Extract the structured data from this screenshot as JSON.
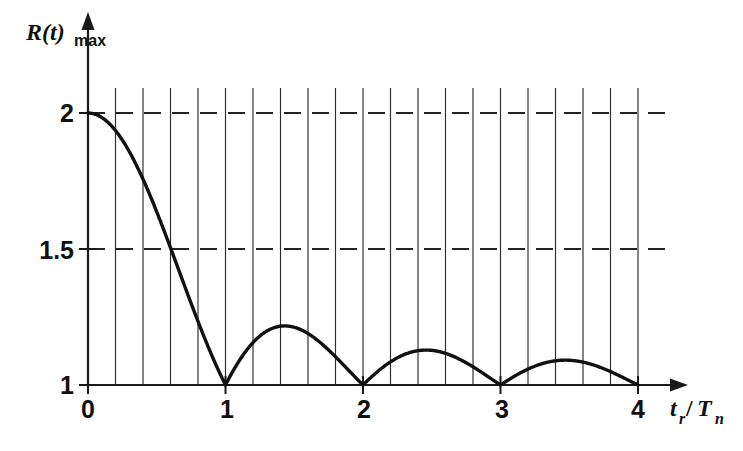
{
  "chart_data": {
    "type": "line",
    "title": "",
    "subtitle": "",
    "xlabel": "t_r/T_n",
    "ylabel": "R(t)max",
    "xlabel_parts": {
      "base1": "t",
      "sub1": "r",
      "slash": "/",
      "base2": "T",
      "sub2": "n"
    },
    "ylabel_parts": {
      "base": "R(t)",
      "sub": "max"
    },
    "xlim": [
      0,
      4
    ],
    "ylim": [
      1,
      2
    ],
    "x_ticks": [
      0,
      1,
      2,
      3,
      4
    ],
    "x_tick_labels": [
      "0",
      "1",
      "2",
      "3",
      "4"
    ],
    "y_ticks": [
      1,
      1.5,
      2
    ],
    "y_tick_labels": [
      "1",
      "1.5",
      "2"
    ],
    "grid": {
      "vertical": true,
      "vertical_spacing": 0.2,
      "vertical_count": 21,
      "vertical_style": "solid",
      "horizontal": true,
      "horizontal_at": [
        1.5,
        2
      ],
      "horizontal_style": "dashed"
    },
    "legend": {
      "visible": false,
      "position": "none"
    },
    "series": [
      {
        "name": "R(t)max",
        "formula": "1 + |sin(pi*x)/(pi*x)|",
        "color": "#111111",
        "x": [
          0,
          0.1,
          0.2,
          0.3,
          0.4,
          0.5,
          0.6,
          0.7,
          0.8,
          0.9,
          1.0,
          1.1,
          1.2,
          1.3,
          1.4,
          1.5,
          1.6,
          1.7,
          1.8,
          1.9,
          2.0,
          2.1,
          2.2,
          2.3,
          2.4,
          2.5,
          2.6,
          2.7,
          2.8,
          2.9,
          3.0,
          3.1,
          3.2,
          3.3,
          3.4,
          3.5,
          3.6,
          3.7,
          3.8,
          3.9,
          4.0
        ],
        "values": [
          2.0,
          1.984,
          1.935,
          1.858,
          1.757,
          1.637,
          1.505,
          1.368,
          1.234,
          1.109,
          1.0,
          1.089,
          1.156,
          1.202,
          1.225,
          1.212,
          1.194,
          1.155,
          1.104,
          1.05,
          1.0,
          1.046,
          1.085,
          1.113,
          1.127,
          1.127,
          1.113,
          1.087,
          1.054,
          1.026,
          1.0,
          1.032,
          1.06,
          1.08,
          1.091,
          1.091,
          1.081,
          1.063,
          1.039,
          1.016,
          1.0
        ]
      }
    ],
    "annotations": [
      {
        "label": "initial value",
        "x": 0,
        "y": 2
      },
      {
        "label": "first zero-crossing lobe minimum",
        "x": 1,
        "y": 1
      },
      {
        "label": "first lobe peak",
        "x": 1.5,
        "y": 1.21
      },
      {
        "label": "second lobe minimum",
        "x": 2,
        "y": 1
      },
      {
        "label": "second lobe peak",
        "x": 2.5,
        "y": 1.13
      },
      {
        "label": "third lobe minimum",
        "x": 3,
        "y": 1
      },
      {
        "label": "third lobe peak",
        "x": 3.5,
        "y": 1.09
      },
      {
        "label": "fourth lobe minimum",
        "x": 4,
        "y": 1
      }
    ],
    "colors": {
      "curve": "#111111",
      "axis": "#1a1a1a",
      "grid": "#2b2b2b",
      "dashed_grid": "#222222",
      "background": "#ffffff"
    }
  }
}
